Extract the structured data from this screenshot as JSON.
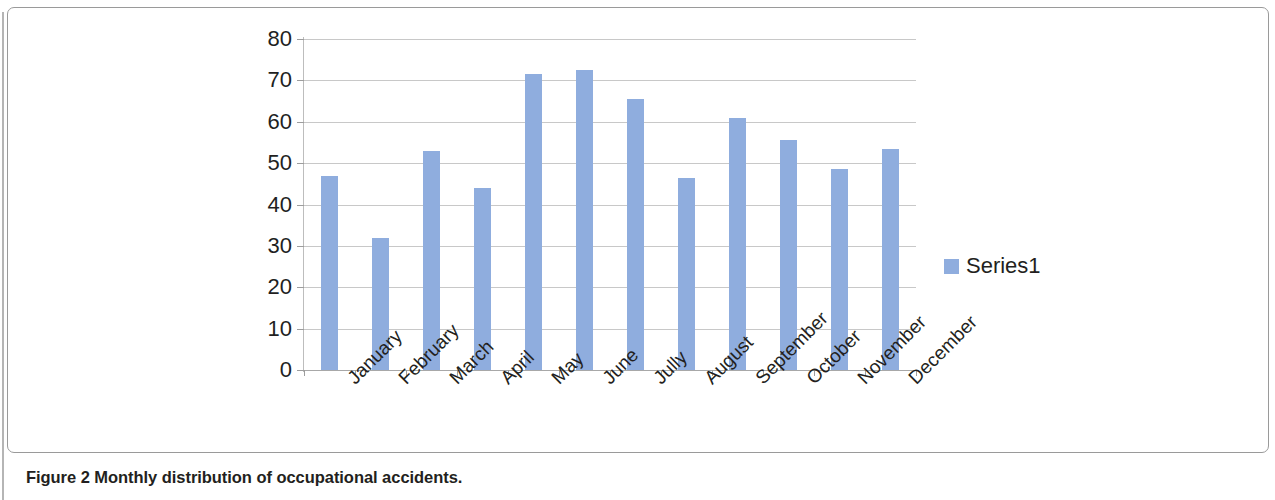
{
  "figure": {
    "caption_label": "Figure 2",
    "caption_text": "Monthly distribution of occupational accidents."
  },
  "legend": {
    "position": "right",
    "entries": [
      {
        "label": "Series1",
        "color": "#8fadde"
      }
    ]
  },
  "chart_data": {
    "type": "bar",
    "title": "",
    "subtitle": "",
    "xlabel": "",
    "ylabel": "",
    "categories": [
      "January",
      "February",
      "March",
      "April",
      "May",
      "June",
      "Jully",
      "August",
      "September",
      "October",
      "November",
      "December"
    ],
    "series": [
      {
        "name": "Series1",
        "color": "#8fadde",
        "values": [
          47,
          32,
          53,
          44,
          71.5,
          72.5,
          65.5,
          46.5,
          61,
          55.5,
          48.5,
          53.5
        ]
      }
    ],
    "ylim": [
      0,
      80
    ],
    "yticks": [
      0,
      10,
      20,
      30,
      40,
      50,
      60,
      70,
      80
    ],
    "ytick_labels": [
      "0",
      "10",
      "20",
      "30",
      "40",
      "50",
      "60",
      "70",
      "80"
    ],
    "grid": true,
    "grid_axis": "y",
    "legend_position": "right",
    "bar_color": "#8fadde"
  }
}
